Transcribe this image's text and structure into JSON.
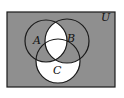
{
  "diagram": {
    "type": "venn",
    "universe_label": "U",
    "sets": [
      {
        "id": "A",
        "label": "A"
      },
      {
        "id": "B",
        "label": "B"
      },
      {
        "id": "C",
        "label": "C"
      }
    ],
    "shaded_regions": [
      "A only",
      "B only",
      "A∩C only",
      "B∩C only",
      "outside all sets"
    ],
    "unshaded_regions": [
      "A∩B (including A∩B∩C)",
      "C only"
    ],
    "colors": {
      "shading": "#8f8f8f",
      "unshaded": "#ffffff",
      "stroke": "#1a1a1a"
    }
  }
}
